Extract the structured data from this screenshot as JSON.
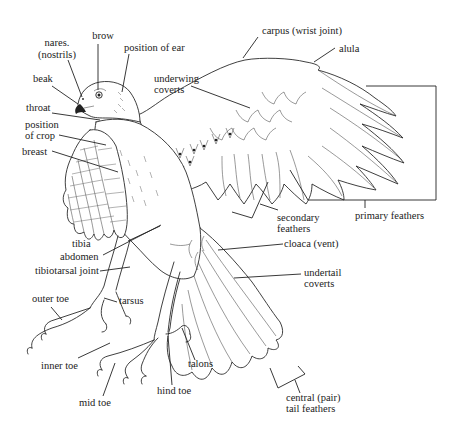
{
  "diagram": {
    "labels": {
      "nares": [
        "nares.",
        "(nostrils)"
      ],
      "brow": "brow",
      "position_of_ear": "position of ear",
      "beak": "beak",
      "throat": "throat",
      "position_of_crop": [
        "position",
        "of crop"
      ],
      "breast": "breast",
      "carpus": "carpus (wrist joint)",
      "alula": "alula",
      "underwing_coverts": [
        "underwing",
        "coverts"
      ],
      "primary_feathers": "primary feathers",
      "secondary_feathers": [
        "secondary",
        "feathers"
      ],
      "cloaca": "cloaca (vent)",
      "undertail_coverts": [
        "undertail",
        "coverts"
      ],
      "tibia": "tibia",
      "abdomen": "abdomen",
      "tibiotarsal_joint": "tibiotarsal joint",
      "outer_toe": "outer toe",
      "tarsus": "tarsus",
      "inner_toe": "inner toe",
      "mid_toe": "mid toe",
      "hind_toe": "hind toe",
      "talons": "talons",
      "central_tail_feathers": [
        "central (pair)",
        "tail feathers"
      ]
    }
  }
}
